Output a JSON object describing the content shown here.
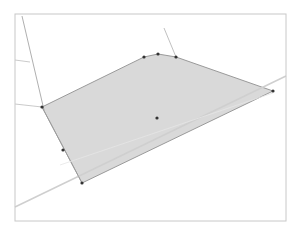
{
  "diagram": {
    "type": "geometry-canvas",
    "frame": {
      "x1": 15,
      "y1": 14,
      "x2": 286,
      "y2": 221,
      "color": "#c8c8c8"
    },
    "polygon": {
      "fill": "#d9d9d9",
      "stroke": "#9a9a9a",
      "vertices": [
        {
          "x": 42,
          "y": 107
        },
        {
          "x": 144,
          "y": 57
        },
        {
          "x": 158,
          "y": 54
        },
        {
          "x": 176,
          "y": 57
        },
        {
          "x": 273,
          "y": 91
        },
        {
          "x": 82,
          "y": 183
        }
      ]
    },
    "points": [
      {
        "x": 42,
        "y": 107
      },
      {
        "x": 144,
        "y": 57
      },
      {
        "x": 158,
        "y": 54
      },
      {
        "x": 176,
        "y": 57
      },
      {
        "x": 273,
        "y": 91
      },
      {
        "x": 82,
        "y": 183
      },
      {
        "x": 63,
        "y": 150
      },
      {
        "x": 157,
        "y": 118
      }
    ],
    "point_color": "#333333",
    "lines": [
      {
        "x1": 15,
        "y1": 207,
        "x2": 286,
        "y2": 76,
        "color": "#cfcfcf"
      },
      {
        "x1": 22,
        "y1": 16,
        "x2": 44,
        "y2": 110,
        "color": "#9a9a9a"
      },
      {
        "x1": 164,
        "y1": 28,
        "x2": 176,
        "y2": 57,
        "color": "#b0b0b0"
      },
      {
        "x1": 15,
        "y1": 104,
        "x2": 42,
        "y2": 107,
        "color": "#bdbdbd"
      },
      {
        "x1": 15,
        "y1": 60,
        "x2": 30,
        "y2": 62,
        "color": "#bdbdbd"
      },
      {
        "x1": 42,
        "y1": 107,
        "x2": 82,
        "y2": 183,
        "color": "#9a9a9a"
      },
      {
        "x1": 60,
        "y1": 165,
        "x2": 273,
        "y2": 93,
        "color": "#e6e6e6"
      }
    ]
  }
}
